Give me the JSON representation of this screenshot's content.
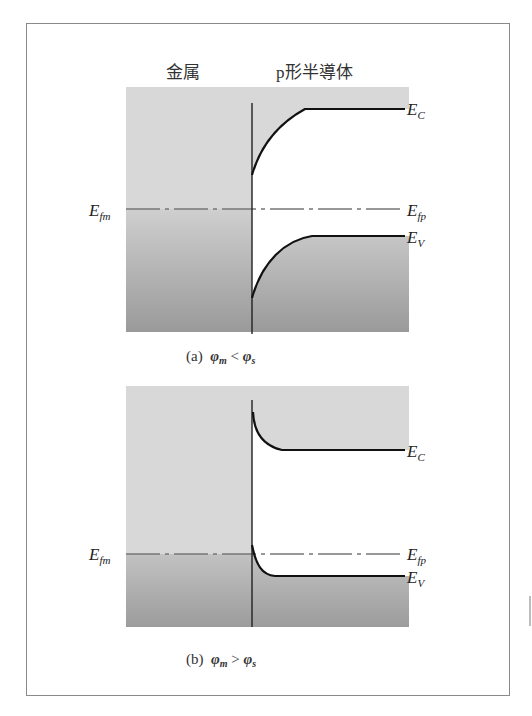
{
  "figure": {
    "region_labels": {
      "metal": "金属",
      "semiconductor": "p形半導体"
    },
    "colors": {
      "band_light": "#d8d8d8",
      "band_dark_bottom": "#9c9c9c",
      "band_mid": "#bdbdbd",
      "band_line": "#111111",
      "fermi_line": "#777777",
      "frame": "#8a8a8a"
    },
    "panels": [
      {
        "id": "a",
        "caption_prefix": "(a)",
        "caption_relation": "<",
        "caption_lhs": "φ",
        "caption_lhs_sub": "m",
        "caption_rhs": "φ",
        "caption_rhs_sub": "s",
        "band_bending": "upward",
        "labels": {
          "metal_fermi": {
            "main": "E",
            "sub": "fm"
          },
          "conduction": {
            "main": "E",
            "sub": "C"
          },
          "semiconductor_fermi": {
            "main": "E",
            "sub": "fp"
          },
          "valence": {
            "main": "E",
            "sub": "V"
          }
        }
      },
      {
        "id": "b",
        "caption_prefix": "(b)",
        "caption_relation": ">",
        "caption_lhs": "φ",
        "caption_lhs_sub": "m",
        "caption_rhs": "φ",
        "caption_rhs_sub": "s",
        "band_bending": "downward",
        "labels": {
          "metal_fermi": {
            "main": "E",
            "sub": "fm"
          },
          "conduction": {
            "main": "E",
            "sub": "C"
          },
          "semiconductor_fermi": {
            "main": "E",
            "sub": "fp"
          },
          "valence": {
            "main": "E",
            "sub": "V"
          }
        }
      }
    ]
  }
}
